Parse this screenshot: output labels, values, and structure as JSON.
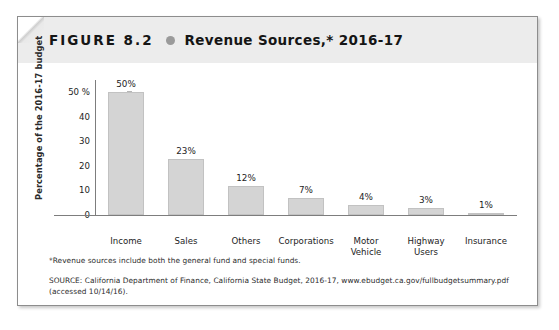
{
  "figure": {
    "number_label": "FIGURE 8.2",
    "bullet_icon": "dot-separator-icon",
    "title": "Revenue Sources,* 2016-17"
  },
  "footnotes": {
    "note": "*Revenue sources include both the general fund and special funds.",
    "source_line1": "SOURCE: California Department of Finance, California State Budget, 2016-17, www.ebudget.ca.gov/fullbudgetsummary.pdf",
    "source_line2": "(accessed 10/14/16)."
  },
  "chart_data": {
    "type": "bar",
    "title": "Revenue Sources,* 2016-17",
    "xlabel": "",
    "ylabel": "Percentage of the 2016-17 budget",
    "categories": [
      "Income",
      "Sales",
      "Others",
      "Corporations",
      "Motor Vehicle",
      "Highway Users",
      "Insurance"
    ],
    "category_lines": [
      [
        "Income"
      ],
      [
        "Sales"
      ],
      [
        "Others"
      ],
      [
        "Corporations"
      ],
      [
        "Motor",
        "Vehicle"
      ],
      [
        "Highway",
        "Users"
      ],
      [
        "Insurance"
      ]
    ],
    "values": [
      50,
      23,
      12,
      7,
      4,
      3,
      1
    ],
    "value_labels": [
      "50%",
      "23%",
      "12%",
      "7%",
      "4%",
      "3%",
      "1%"
    ],
    "ylim": [
      0,
      55
    ],
    "yticks": [
      0,
      10,
      20,
      30,
      40,
      50
    ],
    "ytick_labels": [
      "0",
      "10",
      "20",
      "30",
      "40",
      "50 %"
    ],
    "grid": false,
    "legend": "none",
    "bar_color": "#d4d4d4",
    "axis_color": "#7d7d7d"
  },
  "colors": {
    "header_band": "#ececec",
    "bar_fill": "#d4d4d4",
    "bullet": "#9a9a9a",
    "text": "#151515",
    "border": "#8d8d8d"
  }
}
